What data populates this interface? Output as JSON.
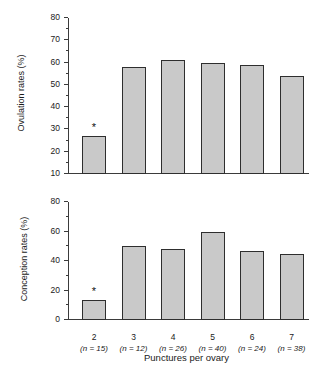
{
  "chart_data": [
    {
      "type": "bar",
      "title": "",
      "xlabel": "Punctures per ovary",
      "ylabel": "Ovulation rates (%)",
      "categories": [
        "2",
        "3",
        "4",
        "5",
        "6",
        "7"
      ],
      "group_sizes": [
        "(n = 15)",
        "(n = 12)",
        "(n = 26)",
        "(n = 40)",
        "(n = 24)",
        "(n = 38)"
      ],
      "values": [
        27,
        58,
        61,
        60,
        59,
        54
      ],
      "ylim": [
        10,
        80
      ],
      "ytick_step": 10,
      "yticks": [
        10,
        20,
        30,
        40,
        50,
        60,
        70,
        80
      ],
      "minor_ticks": true,
      "grid": false,
      "legend": "none",
      "annotations": [
        {
          "category": "2",
          "marker": "*",
          "meaning": "significantly different"
        }
      ],
      "bar_fill_color": "#c9c9c9",
      "bar_edge_color": "#2e2e2e",
      "axis_color": "#3b3b3b"
    },
    {
      "type": "bar",
      "title": "",
      "xlabel": "Punctures per ovary",
      "ylabel": "Conception rates (%)",
      "categories": [
        "2",
        "3",
        "4",
        "5",
        "6",
        "7"
      ],
      "group_sizes": [
        "(n = 15)",
        "(n = 12)",
        "(n = 26)",
        "(n = 40)",
        "(n = 24)",
        "(n = 38)"
      ],
      "values": [
        13.5,
        50.5,
        48,
        60,
        46.5,
        45
      ],
      "ylim": [
        0,
        80
      ],
      "ytick_step": 20,
      "yticks": [
        0,
        20,
        40,
        60,
        80
      ],
      "minor_ticks": true,
      "grid": false,
      "legend": "none",
      "annotations": [
        {
          "category": "2",
          "marker": "*",
          "meaning": "significantly different"
        }
      ],
      "bar_fill_color": "#c9c9c9",
      "bar_edge_color": "#2e2e2e",
      "axis_color": "#3b3b3b"
    }
  ],
  "figure": {
    "xaxis_title": "Punctures per ovary",
    "panels": [
      {
        "id": "top",
        "ylabel": "Ovulation rates (%)",
        "ytick_labels": [
          "80",
          "70",
          "60",
          "50",
          "40",
          "30",
          "20",
          "10"
        ],
        "star": "*"
      },
      {
        "id": "bottom",
        "ylabel": "Conception rates (%)",
        "ytick_labels": [
          "80",
          "60",
          "40",
          "20",
          "0"
        ],
        "star": "*"
      }
    ],
    "categories": [
      {
        "value": "2",
        "n": "(n = 15)"
      },
      {
        "value": "3",
        "n": "(n = 12)"
      },
      {
        "value": "4",
        "n": "(n = 26)"
      },
      {
        "value": "5",
        "n": "(n = 40)"
      },
      {
        "value": "6",
        "n": "(n = 24)"
      },
      {
        "value": "7",
        "n": "(n = 38)"
      }
    ]
  }
}
